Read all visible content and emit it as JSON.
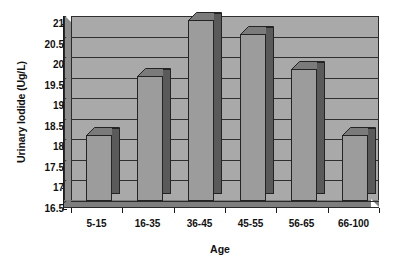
{
  "chart_data": {
    "type": "bar",
    "title": "",
    "subtitle": "",
    "xlabel": "Age",
    "ylabel": "Urinary Iodide (Ug/L)",
    "categories": [
      "5-15",
      "16-35",
      "36-45",
      "45-55",
      "56-65",
      "66-100"
    ],
    "values": [
      18.1,
      19.55,
      20.9,
      20.55,
      19.7,
      18.1
    ],
    "ylim": [
      16.5,
      21
    ],
    "ytick_labels": [
      "21",
      "20.5",
      "20",
      "19.5",
      "19",
      "18.5",
      "18",
      "17.5",
      "17",
      "16.5"
    ],
    "ytick_values": [
      21,
      20.5,
      20,
      19.5,
      19,
      18.5,
      18,
      17.5,
      17,
      16.5
    ],
    "grid": true,
    "legend": "none",
    "style": "3d-bar-grayscale",
    "colors": {
      "bar_front": "#9c9c9c",
      "bar_side": "#5a5a5a",
      "bar_top": "#7b7b7b",
      "plot_background": "#a9a9a9",
      "gridline": "#2f2f2f",
      "axis": "#1a1a1a",
      "text": "#111111",
      "page_background": "#ffffff"
    }
  }
}
